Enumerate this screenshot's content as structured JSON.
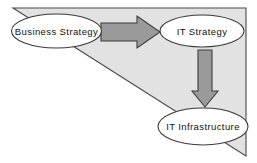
{
  "diagram": {
    "title": "Business Strategy to IT Strategy to IT Infrastructure alignment",
    "background_color": "#ffffff",
    "canvas": {
      "width": 257,
      "height": 163
    },
    "backdrop": {
      "name": "alignment-triangle",
      "shape": "right-triangle",
      "fill_color": "#e2e2e2",
      "stroke_color": "#4a4a4a",
      "points": "13,8 246,8 246,156"
    },
    "nodes": [
      {
        "id": "business-strategy",
        "label": "Business Strategy",
        "shape": "ellipse",
        "cx": 56.5,
        "cy": 31,
        "rx": 45,
        "ry": 17,
        "fill_color": "#ffffff",
        "stroke_color": "#3a3a3a"
      },
      {
        "id": "it-strategy",
        "label": "IT Strategy",
        "shape": "ellipse",
        "cx": 202,
        "cy": 31,
        "rx": 42,
        "ry": 16,
        "fill_color": "#ffffff",
        "stroke_color": "#3a3a3a"
      },
      {
        "id": "it-infrastructure",
        "label": "IT Infrastructure",
        "shape": "ellipse",
        "cx": 203,
        "cy": 126.5,
        "rx": 45,
        "ry": 18.5,
        "fill_color": "#ffffff",
        "stroke_color": "#3a3a3a"
      }
    ],
    "arrows": [
      {
        "id": "arrow-business-to-it-strategy",
        "label": "",
        "direction": "right",
        "from": "business-strategy",
        "to": "it-strategy",
        "fill_color": "#9a9a9a",
        "stroke_color": "#3d3d3d",
        "points": "101,23 137,23 137,16 160,32 137,48 137,41 101,41"
      },
      {
        "id": "arrow-it-strategy-to-infrastructure",
        "label": "",
        "direction": "down",
        "from": "it-strategy",
        "to": "it-infrastructure",
        "fill_color": "#9a9a9a",
        "stroke_color": "#3d3d3d",
        "points": "198,50 212,50 212,91 218,91 205,107 192,91 198,91"
      }
    ]
  }
}
